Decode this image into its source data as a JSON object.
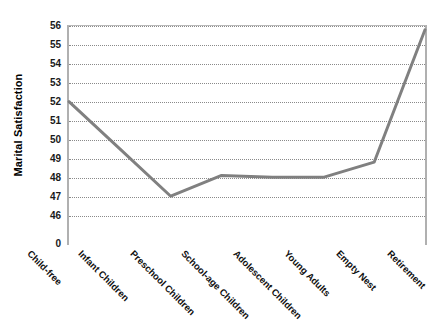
{
  "chart_data": {
    "type": "line",
    "title": "",
    "subtitle": "",
    "xlabel": "",
    "ylabel": "Marital Satisfaction",
    "categories": [
      "Child-free",
      "Infant Children",
      "Preschool Children",
      "School-age Children",
      "Adolescent Children",
      "Young Adults",
      "Empty Nest",
      "Retirement"
    ],
    "values": [
      52.0,
      49.5,
      47.0,
      48.1,
      48.0,
      48.0,
      48.8,
      55.8
    ],
    "series": [
      {
        "name": "Marital Satisfaction",
        "values": [
          52.0,
          49.5,
          47.0,
          48.1,
          48.0,
          48.0,
          48.8,
          55.8
        ],
        "color": "#808080"
      }
    ],
    "ylim": [
      46,
      56
    ],
    "y_ticks": [
      56,
      55,
      54,
      53,
      52,
      51,
      50,
      49,
      48,
      47,
      46,
      0
    ],
    "y_axis_break": true,
    "y_break_label": "0",
    "grid": true,
    "gridline_style": "dotted",
    "gridline_color": "#8a8a8a",
    "legend": false,
    "legend_position": "none",
    "line_color": "#808080",
    "line_width": 3,
    "markers": false,
    "plot_background": "#ffffff",
    "plot_border_color": "#b0b0b0"
  }
}
